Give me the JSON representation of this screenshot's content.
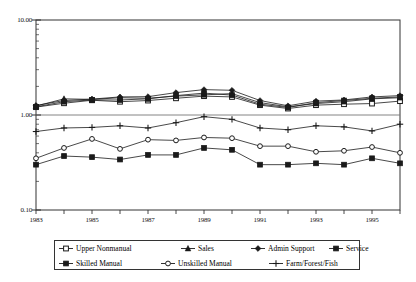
{
  "chart_data": {
    "type": "line",
    "title": "",
    "subtitle": "",
    "xlabel": "",
    "ylabel": "",
    "scale": "log",
    "ylim": [
      0.1,
      10.0
    ],
    "yticks": [
      0.1,
      1.0,
      10.0
    ],
    "ytick_labels": [
      "0.10",
      "1.00",
      "10.00"
    ],
    "grid": true,
    "gridlines_at": [
      1.0
    ],
    "legend_position": "bottom",
    "x": [
      1983,
      1984,
      1985,
      1986,
      1987,
      1988,
      1989,
      1990,
      1991,
      1992,
      1993,
      1994,
      1995,
      1996
    ],
    "xtick_labels": [
      "1983",
      "",
      "1985",
      "",
      "1987",
      "",
      "1989",
      "",
      "1991",
      "",
      "1993",
      "",
      "1995",
      ""
    ],
    "xticks_visible": [
      "1983",
      "1985",
      "1987",
      "1989",
      "1991",
      "1993",
      "1995"
    ],
    "series": [
      {
        "name": "Upper Nonmanual",
        "marker": "open-square",
        "values": [
          1.21,
          1.33,
          1.43,
          1.38,
          1.42,
          1.5,
          1.58,
          1.55,
          1.27,
          1.17,
          1.27,
          1.3,
          1.32,
          1.4
        ]
      },
      {
        "name": "Sales",
        "marker": "filled-triangle",
        "values": [
          1.24,
          1.48,
          1.46,
          1.52,
          1.5,
          1.58,
          1.63,
          1.68,
          1.35,
          1.22,
          1.32,
          1.38,
          1.48,
          1.52
        ]
      },
      {
        "name": "Admin Support",
        "marker": "plus-diamond",
        "values": [
          1.26,
          1.42,
          1.47,
          1.55,
          1.56,
          1.72,
          1.85,
          1.82,
          1.42,
          1.25,
          1.4,
          1.44,
          1.55,
          1.6
        ]
      },
      {
        "name": "Service",
        "marker": "filled-square",
        "values": [
          1.22,
          1.38,
          1.44,
          1.44,
          1.48,
          1.6,
          1.7,
          1.62,
          1.3,
          1.2,
          1.35,
          1.42,
          1.5,
          1.55
        ]
      },
      {
        "name": "Skilled Manual",
        "marker": "filled-square",
        "values": [
          0.3,
          0.37,
          0.36,
          0.34,
          0.38,
          0.38,
          0.45,
          0.43,
          0.3,
          0.3,
          0.31,
          0.3,
          0.35,
          0.31
        ]
      },
      {
        "name": "Unskilled Manual",
        "marker": "open-circle",
        "values": [
          0.35,
          0.45,
          0.56,
          0.44,
          0.55,
          0.54,
          0.58,
          0.57,
          0.47,
          0.47,
          0.41,
          0.42,
          0.46,
          0.4
        ]
      },
      {
        "name": "Farm/Forest/Fish",
        "marker": "plus",
        "values": [
          0.67,
          0.73,
          0.74,
          0.77,
          0.73,
          0.83,
          0.96,
          0.9,
          0.73,
          0.7,
          0.77,
          0.75,
          0.68,
          0.8
        ]
      }
    ]
  },
  "axes": {
    "y_labels": [
      "10.00",
      "1.00",
      "0.10"
    ],
    "x_labels": [
      "1983",
      "1985",
      "1987",
      "1989",
      "1991",
      "1993",
      "1995"
    ]
  },
  "legend": {
    "row1": [
      {
        "label": "Upper Nonmanual",
        "marker": "open-square"
      },
      {
        "label": "Sales",
        "marker": "filled-triangle"
      },
      {
        "label": "Admin Support",
        "marker": "plus-diamond"
      },
      {
        "label": "Service",
        "marker": "filled-square"
      }
    ],
    "row2": [
      {
        "label": "Skilled Manual",
        "marker": "filled-square"
      },
      {
        "label": "Unskilled Manual",
        "marker": "open-circle"
      },
      {
        "label": "Farm/Forest/Fish",
        "marker": "plus"
      }
    ]
  },
  "colors": {
    "line": "#1a1a1a",
    "axis": "#333333",
    "grid": "#777777",
    "background": "#ffffff"
  }
}
